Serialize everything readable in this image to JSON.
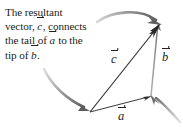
{
  "figure": {
    "name": "vector-addition-resultant-diagram",
    "background_color": "#ffffff",
    "ink_color": "#231f20",
    "accent_gray": "#9a9a9a",
    "caption": {
      "full_text": "The resultant vector, c, connects the tail of a to the tip of b.",
      "lines": [
        {
          "id": "line1",
          "before": "The resultant",
          "vector": "",
          "after": ""
        },
        {
          "id": "line2",
          "before": "vector, ",
          "vector": "c",
          "after": ", connects"
        },
        {
          "id": "line3",
          "before": "the tail of ",
          "vector": "a",
          "after": " to the"
        },
        {
          "id": "line4",
          "before": "tip of ",
          "vector": "b",
          "after": "."
        }
      ]
    },
    "vectors": [
      {
        "id": "a",
        "label": "a",
        "description": "horizontal base vector pointing right",
        "color": "#3b3a3c",
        "tail": [
          90,
          112
        ],
        "tip": [
          151,
          96
        ]
      },
      {
        "id": "b",
        "label": "b",
        "description": "vertical vector pointing up",
        "color": "#8f8f91",
        "tail": [
          151,
          96
        ],
        "tip": [
          158,
          25
        ]
      },
      {
        "id": "c",
        "label": "c",
        "description": "resultant vector from tail of a to tip of b",
        "color": "#2e2d2f",
        "tail": [
          90,
          112
        ],
        "tip": [
          160,
          24
        ]
      }
    ],
    "pointer_arrows": [
      {
        "id": "pointer-to-tip-of-b",
        "color": "#7d7d7f",
        "target": [
          160,
          24
        ],
        "description": "curved gray arrow sweeping right to the tip of b"
      },
      {
        "id": "pointer-to-tail-of-a",
        "color": "#7d7d7f",
        "target": [
          90,
          112
        ],
        "description": "curved gray arrow sweeping down-right to the tail of a"
      },
      {
        "id": "pointer-to-junction",
        "color": "#9b9b9d",
        "target": [
          151,
          96
        ],
        "description": "curved gray arrow arriving at the tip of a / tail of b"
      }
    ],
    "labels": {
      "c": "c",
      "b": "b",
      "a": "a"
    }
  }
}
